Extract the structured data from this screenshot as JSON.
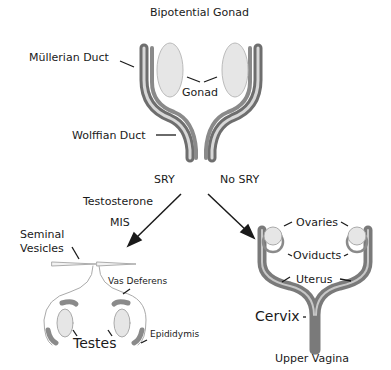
{
  "title": "Bipotential Gonad",
  "bipotential": {
    "mullerian_duct": "Müllerian Duct",
    "gonad": "Gonad",
    "wolffian_duct": "Wolffian Duct"
  },
  "branches": {
    "left_condition": "SRY",
    "right_condition": "No SRY",
    "left_hormones": [
      "Testosterone",
      "MIS"
    ]
  },
  "male": {
    "seminal_vesicles_line1": "Seminal",
    "seminal_vesicles_line2": "Vesicles",
    "vas_deferens": "Vas Deferens",
    "epididymis": "Epididymis",
    "testes": "Testes"
  },
  "female": {
    "ovaries": "Ovaries",
    "oviducts": "Oviducts",
    "uterus": "Uterus",
    "cervix": "Cervix",
    "upper_vagina": "Upper Vagina"
  },
  "colors": {
    "duct_dark": "#6e6e6e",
    "duct_light": "#d8d8d8",
    "gonad_fill": "#e6e6e6",
    "text": "#1a1a1a"
  }
}
